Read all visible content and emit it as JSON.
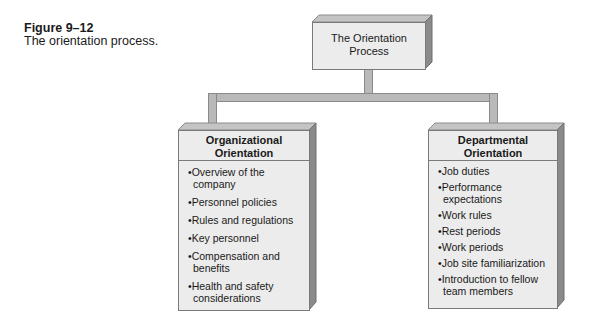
{
  "caption": {
    "figure_label": "Figure 9–12",
    "description": "The orientation process."
  },
  "root": {
    "title_line1": "The Orientation",
    "title_line2": "Process"
  },
  "children": [
    {
      "title_line1": "Organizational",
      "title_line2": "Orientation",
      "items": [
        "•Overview of the company",
        "•Personnel policies",
        "•Rules and regulations",
        "•Key personnel",
        "•Compensation and benefits",
        "•Health and safety considerations"
      ]
    },
    {
      "title_line1": "Departmental",
      "title_line2": "Orientation",
      "items": [
        "•Job duties",
        "•Performance expectations",
        "•Work rules",
        "•Rest periods",
        "•Work periods",
        "•Job site familiarization",
        "•Introduction to fellow team members"
      ]
    }
  ],
  "colors": {
    "box_face": "#ececec",
    "box_top": "#c4c4c4",
    "box_side": "#8a8a8a",
    "connector": "#b9b9b9"
  }
}
